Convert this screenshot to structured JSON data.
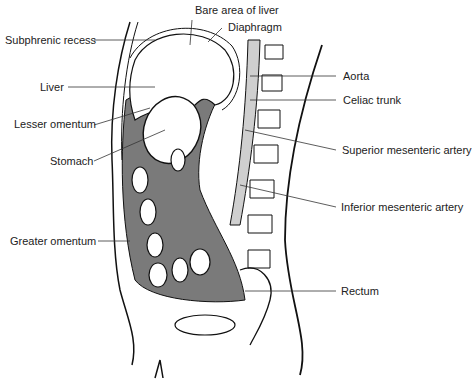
{
  "figure": {
    "type": "anatomical sagittal section",
    "labels_left": {
      "subphrenic_recess": "Subphrenic recess",
      "liver": "Liver",
      "lesser_omentum": "Lesser omentum",
      "stomach": "Stomach",
      "greater_omentum": "Greater omentum"
    },
    "labels_top": {
      "bare_area": "Bare area of liver",
      "diaphragm": "Diaphragm"
    },
    "labels_right": {
      "aorta": "Aorta",
      "celiac_trunk": "Celiac trunk",
      "superior_mesenteric": "Superior mesenteric artery",
      "inferior_mesenteric": "Inferior mesenteric artery",
      "rectum": "Rectum"
    },
    "colors": {
      "line": "#111111",
      "peritoneum_fill": "#7a7a7a",
      "aorta_fill": "#cfcfcf",
      "background": "#ffffff"
    }
  }
}
